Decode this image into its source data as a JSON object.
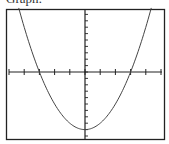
{
  "caption": "Graph:",
  "chart_data": {
    "type": "line",
    "title": "",
    "xlabel": "",
    "ylabel": "",
    "function": "y = x^2 - 9",
    "xlim": [
      -5,
      5
    ],
    "ylim": [
      -10,
      10
    ],
    "x_tick_step": 1,
    "y_tick_step": 1,
    "grid": false,
    "x": [
      -4.36,
      -4,
      -3,
      -2,
      -1,
      0,
      1,
      2,
      3,
      4,
      4.36
    ],
    "values": [
      10,
      7,
      0,
      -5,
      -8,
      -9,
      -8,
      -5,
      0,
      7,
      10
    ],
    "roots": [
      -3,
      3
    ],
    "vertex": [
      0,
      -9
    ]
  },
  "colors": {
    "frame": "#222222",
    "curve": "#444444",
    "axis": "#222222"
  }
}
